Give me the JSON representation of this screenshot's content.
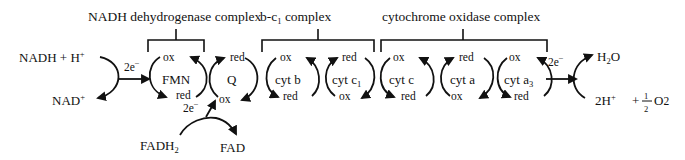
{
  "complexes": [
    {
      "name": "NADH dehydrogenase complex"
    },
    {
      "name": "b-c",
      "name_sub": "1",
      "name_suffix": " complex"
    },
    {
      "name": "cytochrome oxidase complex"
    }
  ],
  "carriers": [
    {
      "name": "FMN",
      "top": "ox",
      "bottom": "red"
    },
    {
      "name": "Q",
      "top": "red",
      "bottom": "ox"
    },
    {
      "name": "cyt b",
      "top": "ox",
      "bottom": "red"
    },
    {
      "name": "cyt c",
      "name_sub": "1",
      "top": "red",
      "bottom": "ox"
    },
    {
      "name": "cyt c",
      "top": "ox",
      "bottom": "red"
    },
    {
      "name": "cyt a",
      "top": "red",
      "bottom": "ox"
    },
    {
      "name": "cyt a",
      "name_sub": "3",
      "top": "ox",
      "bottom": "red"
    }
  ],
  "inputs": {
    "nadh": "NADH + H",
    "nadh_sup": "+",
    "nad": "NAD",
    "nad_sup": "+",
    "fadh": "FADH",
    "fadh_sub": "2",
    "fad": "FAD",
    "electrons": "2e",
    "electrons_sup": "−"
  },
  "outputs": {
    "h2o_h": "H",
    "h2o_sub": "2",
    "h2o_o": "O",
    "protons": "2H",
    "protons_sup": "+",
    "plus": "+",
    "frac_num": "1",
    "frac_den": "2",
    "oxygen": "O",
    "oxygen_sub": "2"
  }
}
